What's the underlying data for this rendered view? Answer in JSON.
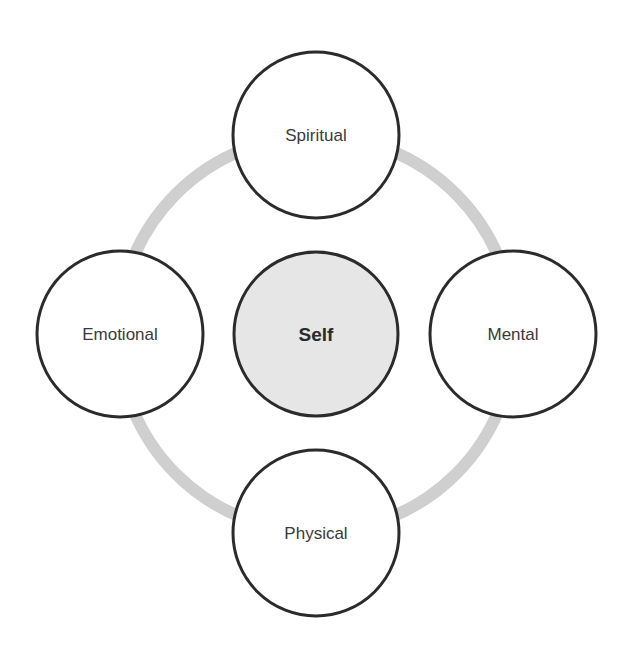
{
  "diagram": {
    "type": "hub-and-ring",
    "colors": {
      "background": "#ffffff",
      "ring": "#cfcfcf",
      "node_stroke": "#2b2b2b",
      "node_fill": "#ffffff",
      "center_fill": "#e6e6e6",
      "text": "#3a3a3a"
    },
    "center": {
      "label": "Self"
    },
    "nodes": [
      {
        "id": "top",
        "label": "Spiritual"
      },
      {
        "id": "right",
        "label": "Mental"
      },
      {
        "id": "bottom",
        "label": "Physical"
      },
      {
        "id": "left",
        "label": "Emotional"
      }
    ]
  }
}
